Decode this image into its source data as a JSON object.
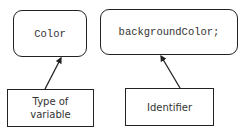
{
  "diagram": {
    "code_boxes": [
      {
        "id": "type",
        "text": "Color"
      },
      {
        "id": "identifier",
        "text": "backgroundColor;"
      }
    ],
    "label_boxes": [
      {
        "id": "type-label",
        "text": "Type of\nvariable",
        "points_to": "type"
      },
      {
        "id": "identifier-label",
        "text": "Identifier",
        "points_to": "identifier"
      }
    ],
    "colors": {
      "stroke": "#222222",
      "text": "#333333",
      "background": "#ffffff"
    }
  }
}
